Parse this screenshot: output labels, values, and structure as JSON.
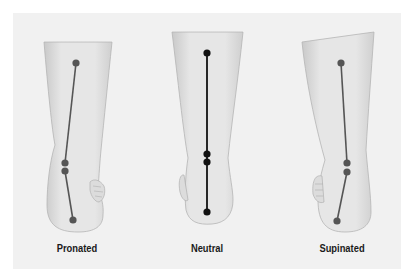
{
  "figure": {
    "background": "#f1f1f1",
    "panels": [
      {
        "id": "pronated",
        "label": "Pronated",
        "line_color": "#555555",
        "dot_color": "#555555"
      },
      {
        "id": "neutral",
        "label": "Neutral",
        "line_color": "#111111",
        "dot_color": "#111111"
      },
      {
        "id": "supinated",
        "label": "Supinated",
        "line_color": "#555555",
        "dot_color": "#555555"
      }
    ]
  }
}
